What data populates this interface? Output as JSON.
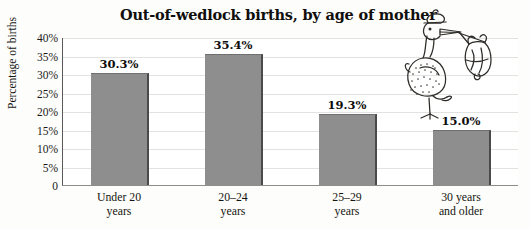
{
  "chart_data": {
    "type": "bar",
    "title": "Out-of-wedlock births, by age of mother",
    "xlabel": "",
    "ylabel": "Percentage of births",
    "categories": [
      "Under 20 years",
      "20–24 years",
      "25–29 years",
      "30 years and older"
    ],
    "category_lines": [
      [
        "Under 20",
        "years"
      ],
      [
        "20–24",
        "years"
      ],
      [
        "25–29",
        "years"
      ],
      [
        "30 years",
        "and older"
      ]
    ],
    "values": [
      30.3,
      35.4,
      19.3,
      15.0
    ],
    "value_labels": [
      "30.3%",
      "35.4%",
      "19.3%",
      "15.0%"
    ],
    "ylim": [
      0,
      40
    ],
    "ytick_values": [
      40,
      35,
      30,
      25,
      20,
      15,
      10,
      5,
      0
    ],
    "ytick_labels": [
      "40%",
      "35%",
      "30%",
      "25%",
      "20%",
      "15%",
      "10%",
      "5%",
      "0"
    ],
    "grid": true,
    "legend": false,
    "bar_color": "#8e8e8e",
    "bar_edge_color": "#4a4a4a",
    "grid_color": "#e2e2e0",
    "axis_color": "#595959",
    "background_color": "#fdfdfb",
    "text_color": "#100f0d"
  },
  "decorations": {
    "stork": "stork-carrying-baby-bundle-illustration"
  }
}
